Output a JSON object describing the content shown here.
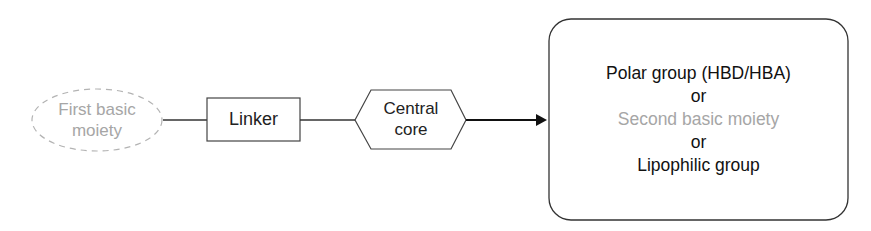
{
  "diagram": {
    "nodes": {
      "first_basic_moiety": {
        "line1": "First basic",
        "line2": "moiety",
        "shape": "dashed-ellipse",
        "color": "#a6a6a6"
      },
      "linker": {
        "label": "Linker",
        "shape": "rectangle"
      },
      "central_core": {
        "line1": "Central",
        "line2": "core",
        "shape": "hexagon"
      },
      "terminal_group": {
        "shape": "rounded-rectangle",
        "lines": [
          {
            "text": "Polar group (HBD/HBA)",
            "color": "#111111"
          },
          {
            "text": "or",
            "color": "#111111"
          },
          {
            "text": "Second basic moiety",
            "color": "#a6a6a6"
          },
          {
            "text": "or",
            "color": "#111111"
          },
          {
            "text": "Lipophilic group",
            "color": "#111111"
          }
        ]
      }
    },
    "edges": [
      {
        "from": "first_basic_moiety",
        "to": "linker",
        "type": "line"
      },
      {
        "from": "linker",
        "to": "central_core",
        "type": "line"
      },
      {
        "from": "central_core",
        "to": "terminal_group",
        "type": "arrow"
      }
    ]
  }
}
